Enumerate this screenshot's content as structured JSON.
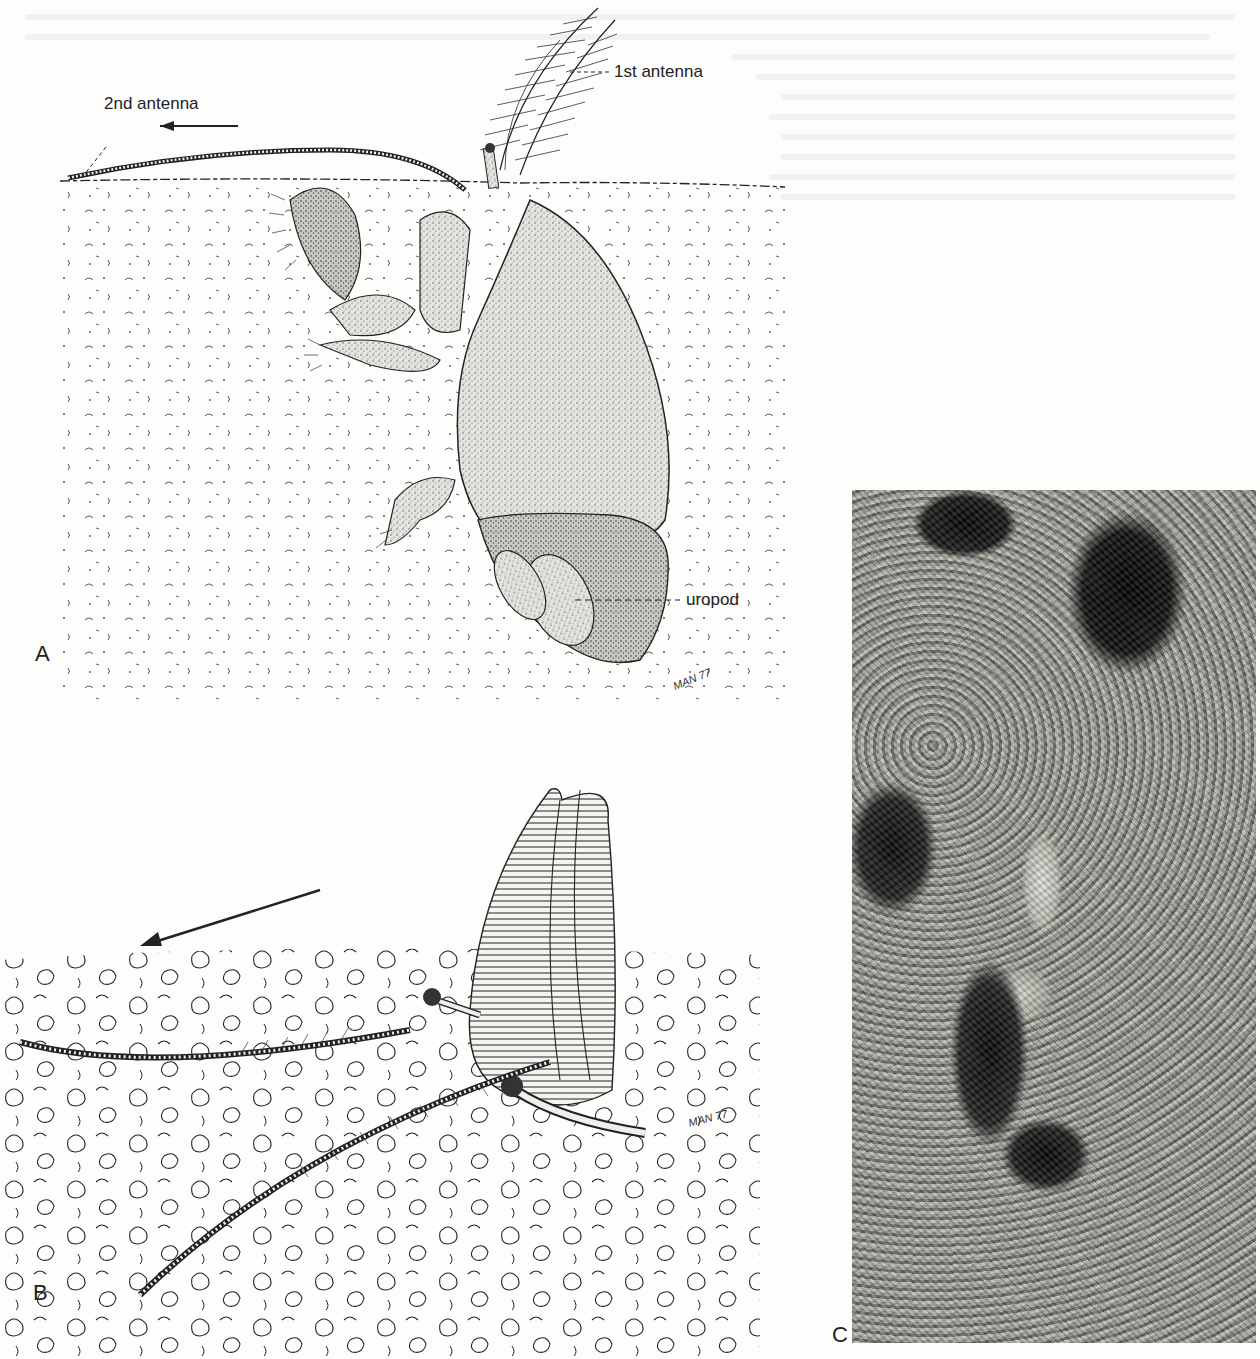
{
  "figure": {
    "panels": [
      {
        "letter": "A",
        "labels": {
          "first_antenna": "1st antenna",
          "second_antenna": "2nd antenna",
          "uropod": "uropod"
        },
        "signature": "MAN 77",
        "arrow": "left"
      },
      {
        "letter": "B",
        "signature": "MAN 77",
        "arrow": "lower-left"
      },
      {
        "letter": "C",
        "type": "photograph"
      }
    ]
  }
}
